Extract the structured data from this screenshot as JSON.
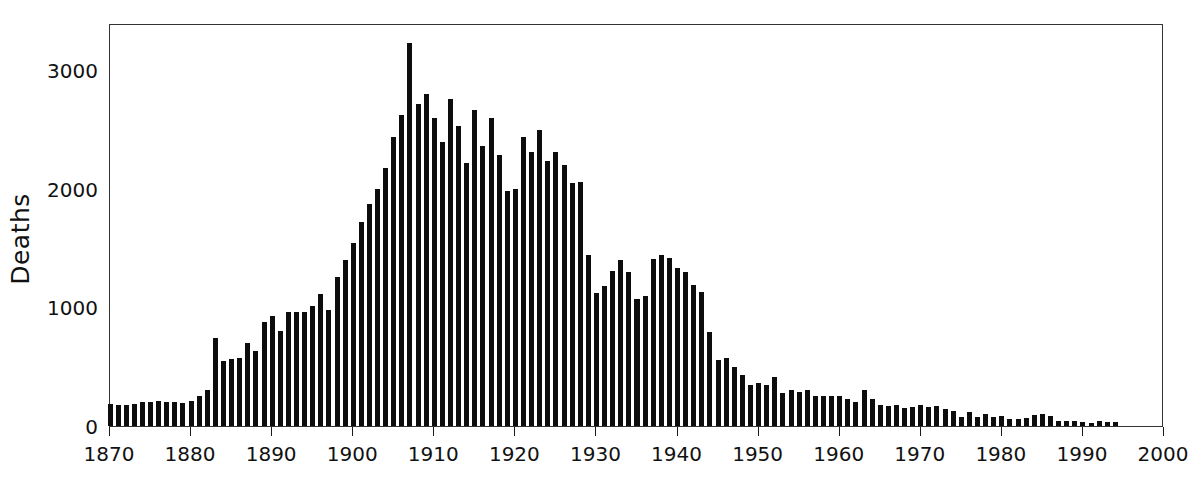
{
  "chart_data": {
    "type": "bar",
    "title": "",
    "subtitle": "",
    "xlabel": "",
    "ylabel": "Deaths",
    "xlim": [
      1870,
      2000
    ],
    "ylim": [
      0,
      3400
    ],
    "grid": false,
    "legend": null,
    "bar_color": "#0d0d0d",
    "axis_color": "#333333",
    "xticks": [
      1870,
      1880,
      1890,
      1900,
      1910,
      1920,
      1930,
      1940,
      1950,
      1960,
      1970,
      1980,
      1990,
      2000
    ],
    "xticklabels": [
      "1870",
      "1880",
      "1890",
      "1900",
      "1910",
      "1920",
      "1930",
      "1940",
      "1950",
      "1960",
      "1970",
      "1980",
      "1990",
      "2000"
    ],
    "yticks": [
      0,
      1000,
      2000,
      3000
    ],
    "yticklabels": [
      "0",
      "1000",
      "2000",
      "3000"
    ],
    "x": [
      1870,
      1871,
      1872,
      1873,
      1874,
      1875,
      1876,
      1877,
      1878,
      1879,
      1880,
      1881,
      1882,
      1883,
      1884,
      1885,
      1886,
      1887,
      1888,
      1889,
      1890,
      1891,
      1892,
      1893,
      1894,
      1895,
      1896,
      1897,
      1898,
      1899,
      1900,
      1901,
      1902,
      1903,
      1904,
      1905,
      1906,
      1907,
      1908,
      1909,
      1910,
      1911,
      1912,
      1913,
      1914,
      1915,
      1916,
      1917,
      1918,
      1919,
      1920,
      1921,
      1922,
      1923,
      1924,
      1925,
      1926,
      1927,
      1928,
      1929,
      1930,
      1931,
      1932,
      1933,
      1934,
      1935,
      1936,
      1937,
      1938,
      1939,
      1940,
      1941,
      1942,
      1943,
      1944,
      1945,
      1946,
      1947,
      1948,
      1949,
      1950,
      1951,
      1952,
      1953,
      1954,
      1955,
      1956,
      1957,
      1958,
      1959,
      1960,
      1961,
      1962,
      1963,
      1964,
      1965,
      1966,
      1967,
      1968,
      1969,
      1970,
      1971,
      1972,
      1973,
      1974,
      1975,
      1976,
      1977,
      1978,
      1979,
      1980,
      1981,
      1982,
      1983,
      1984,
      1985,
      1986,
      1987,
      1988,
      1989,
      1990,
      1991,
      1992,
      1993,
      1994
    ],
    "values": [
      185,
      175,
      180,
      185,
      200,
      205,
      210,
      200,
      205,
      195,
      210,
      255,
      300,
      745,
      545,
      565,
      570,
      700,
      635,
      875,
      930,
      800,
      960,
      965,
      965,
      1015,
      1110,
      975,
      1255,
      1400,
      1540,
      1725,
      1870,
      2000,
      2175,
      2440,
      2625,
      3230,
      2720,
      2800,
      2600,
      2400,
      2760,
      2530,
      2220,
      2665,
      2360,
      2600,
      2285,
      1980,
      2000,
      2440,
      2310,
      2500,
      2240,
      2310,
      2200,
      2050,
      2060,
      1440,
      1120,
      1180,
      1310,
      1400,
      1300,
      1075,
      1095,
      1410,
      1445,
      1415,
      1330,
      1300,
      1190,
      1130,
      790,
      555,
      570,
      495,
      430,
      350,
      360,
      350,
      415,
      280,
      300,
      290,
      300,
      255,
      250,
      250,
      250,
      225,
      200,
      300,
      225,
      180,
      165,
      180,
      155,
      160,
      175,
      160,
      170,
      140,
      130,
      75,
      115,
      80,
      105,
      75,
      85,
      60,
      60,
      65,
      95,
      100,
      85,
      40,
      40,
      45,
      35,
      25,
      40,
      35,
      30
    ]
  }
}
